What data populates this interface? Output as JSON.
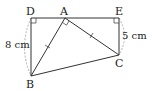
{
  "figure": {
    "points": {
      "D": {
        "label": "D",
        "x": 31,
        "y": 18
      },
      "A": {
        "label": "A",
        "x": 65,
        "y": 18
      },
      "E": {
        "label": "E",
        "x": 119,
        "y": 18
      },
      "C": {
        "label": "C",
        "x": 119,
        "y": 55
      },
      "B": {
        "label": "B",
        "x": 31,
        "y": 76
      }
    },
    "measurements": {
      "DB": "8 cm",
      "EC": "5 cm"
    },
    "marks": {
      "right_angles": [
        "D",
        "A",
        "E"
      ],
      "equal_segments": [
        "AB",
        "AC"
      ]
    },
    "colors": {
      "line": "#333333",
      "arc": "#9a9a9a"
    }
  }
}
